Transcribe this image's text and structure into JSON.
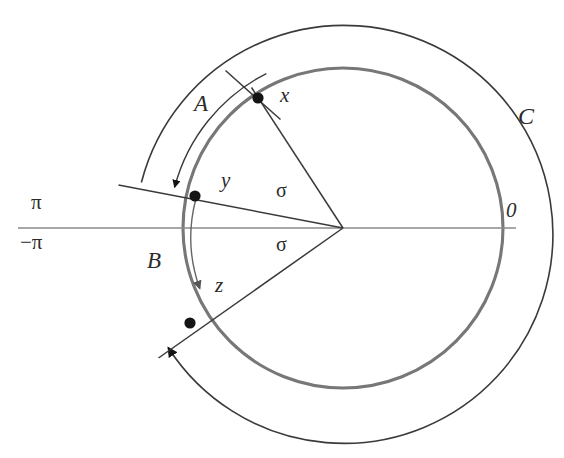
{
  "figure": {
    "background_color": "#ffffff",
    "line_color": "#3a3a3a",
    "inner_circle_color": "#777777",
    "axis_color": "#888888",
    "point_color": "#141414"
  },
  "labels": {
    "pi": "π",
    "minus_pi": "−π",
    "zero": "0",
    "outer_circle": "C",
    "arc_a": "A",
    "arc_b": "B",
    "point_x": "x",
    "point_y": "y",
    "point_z": "z",
    "sigma_upper": "σ",
    "sigma_lower": "σ"
  },
  "geometry": {
    "center": {
      "x": 343,
      "y": 228
    },
    "inner_radius": 160,
    "outer_radius": 209,
    "arc_a_radius": 178,
    "arc_b_radius": 150,
    "point_x": {
      "x": 258,
      "y": 98
    },
    "point_y": {
      "x": 195,
      "y": 196
    },
    "point_z": {
      "x": 190,
      "y": 323
    },
    "axis_y": 228,
    "axis_x_start": 18,
    "axis_x_end": 516,
    "angle_x_deg": 123,
    "angle_y_deg": 169,
    "angle_z_deg": 196,
    "sigma_upper_deg": 169,
    "sigma_lower_deg": 196
  },
  "label_positions": {
    "pi": {
      "x": 31,
      "y": 198
    },
    "minus_pi": {
      "x": 20,
      "y": 238
    },
    "zero": {
      "x": 508,
      "y": 208
    },
    "outer_circle": {
      "x": 520,
      "y": 110
    },
    "arc_a": {
      "x": 195,
      "y": 97
    },
    "arc_b": {
      "x": 148,
      "y": 253
    },
    "point_x": {
      "x": 281,
      "y": 92
    },
    "point_y": {
      "x": 222,
      "y": 178
    },
    "point_z": {
      "x": 216,
      "y": 282
    },
    "sigma_upper": {
      "x": 277,
      "y": 188
    },
    "sigma_lower": {
      "x": 277,
      "y": 242
    }
  }
}
